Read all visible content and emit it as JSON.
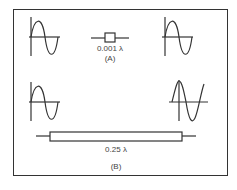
{
  "figure": {
    "part_a": {
      "component_label": "0.001 λ",
      "part_label": "(A)",
      "left_waveform": "sine-in-phase",
      "right_waveform": "sine-in-phase"
    },
    "part_b": {
      "component_label": "0.25 λ",
      "part_label": "(B)",
      "left_waveform": "sine-in-phase",
      "right_waveform": "sine-shifted-90-degrees"
    },
    "colors": {
      "stroke": "#333333",
      "text": "#444444"
    }
  }
}
